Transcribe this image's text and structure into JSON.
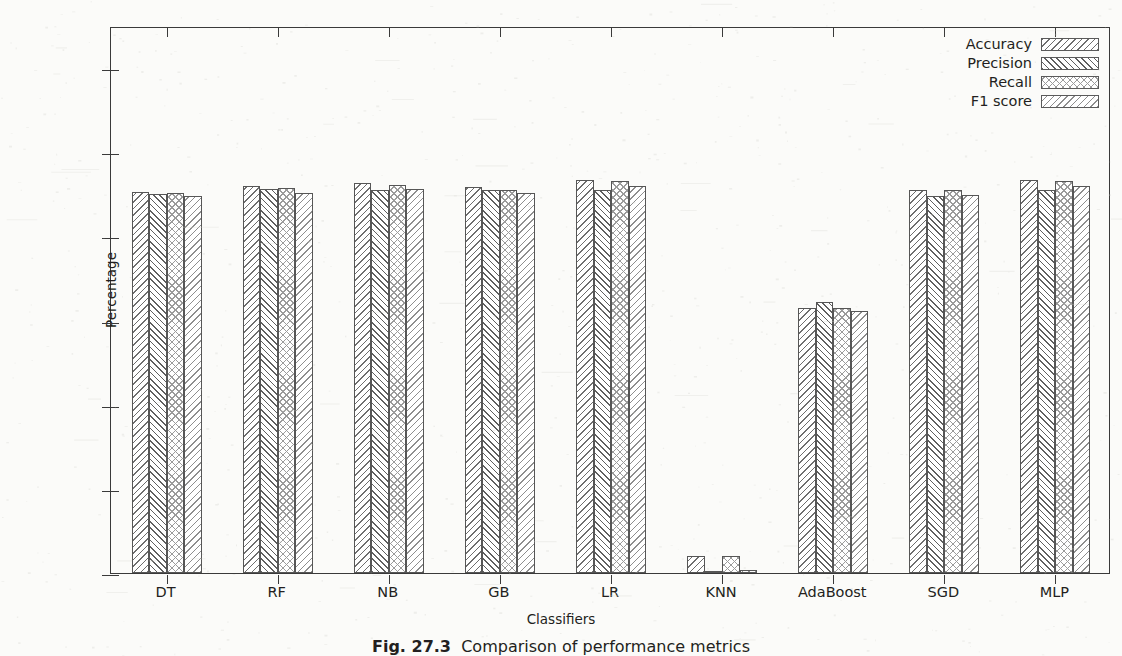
{
  "figure": {
    "caption_label": "Fig. 27.3",
    "caption_text": "Comparison of performance metrics"
  },
  "chart_data": {
    "type": "bar",
    "title": "",
    "xlabel": "Classifiers",
    "ylabel": "Percentage",
    "ylim": [
      0,
      130
    ],
    "yticks": [
      0,
      20,
      40,
      60,
      80,
      100,
      120
    ],
    "ytick_labels": [
      "0",
      "20",
      "40",
      "60",
      "80",
      "100",
      "120"
    ],
    "grid": false,
    "legend_position": "upper right",
    "categories": [
      "DT",
      "RF",
      "NB",
      "GB",
      "LR",
      "KNN",
      "AdaBoost",
      "SGD",
      "MLP"
    ],
    "series": [
      {
        "name": "Accuracy",
        "hatch": "backslash",
        "color": "#ffffff",
        "values": [
          90.5,
          92.0,
          92.7,
          91.8,
          93.5,
          4.0,
          63.0,
          91.0,
          93.5
        ]
      },
      {
        "name": "Precision",
        "hatch": "slash",
        "color": "#ffffff",
        "values": [
          90.0,
          91.2,
          91.0,
          91.0,
          91.0,
          0.2,
          64.3,
          89.6,
          91.1
        ]
      },
      {
        "name": "Recall",
        "hatch": "crosshatch",
        "color": "#ffffff",
        "values": [
          90.3,
          91.6,
          92.3,
          91.0,
          93.1,
          4.0,
          63.0,
          91.0,
          93.2
        ]
      },
      {
        "name": "F1 score",
        "hatch": "backslash-light",
        "color": "#ffffff",
        "values": [
          89.7,
          90.4,
          91.2,
          90.4,
          91.9,
          0.7,
          62.2,
          89.9,
          91.9
        ]
      }
    ]
  }
}
